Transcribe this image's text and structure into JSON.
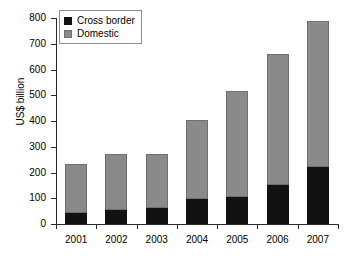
{
  "chart_data": {
    "type": "bar",
    "stacked": true,
    "title": "",
    "xlabel": "",
    "ylabel": "US$ billion",
    "categories": [
      "2001",
      "2002",
      "2003",
      "2004",
      "2005",
      "2006",
      "2007"
    ],
    "series": [
      {
        "name": "Cross border",
        "color": "#121212",
        "values": [
          42,
          53,
          62,
          98,
          105,
          153,
          220
        ]
      },
      {
        "name": "Domestic",
        "color": "#8a8a8a",
        "values": [
          190,
          217,
          211,
          307,
          410,
          507,
          570
        ]
      }
    ],
    "totals": [
      232,
      270,
      273,
      405,
      515,
      660,
      790
    ],
    "ylim": [
      0,
      800
    ],
    "yticks": [
      0,
      100,
      200,
      300,
      400,
      500,
      600,
      700,
      800
    ],
    "ytick_labels": [
      "0",
      "100",
      "200",
      "300",
      "400",
      "500",
      "600",
      "700",
      "800"
    ],
    "grid": false,
    "legend_position": "top-left",
    "legend_entries": [
      "Cross border",
      "Domestic"
    ]
  },
  "axes": {
    "y_title": "US$ billion"
  }
}
